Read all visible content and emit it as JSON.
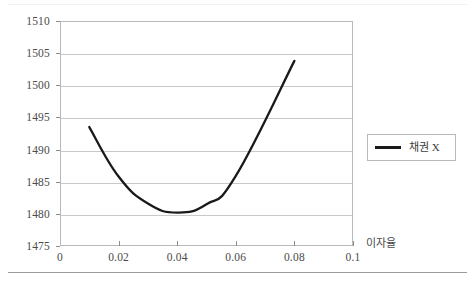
{
  "chart_data": {
    "type": "line",
    "title": "",
    "subtitle": "",
    "xlabel": "이자율",
    "ylabel": "",
    "xlim": [
      0,
      0.1
    ],
    "ylim": [
      1475,
      1510
    ],
    "grid": true,
    "legend_position": "right",
    "x_ticks": [
      "0",
      "0.02",
      "0.04",
      "0.06",
      "0.08",
      "0.1"
    ],
    "x_tick_values": [
      0,
      0.02,
      0.04,
      0.06,
      0.08,
      0.1
    ],
    "y_ticks": [
      "1475",
      "1480",
      "1485",
      "1490",
      "1495",
      "1500",
      "1505",
      "1510"
    ],
    "y_tick_values": [
      1475,
      1480,
      1485,
      1490,
      1495,
      1500,
      1505,
      1510
    ],
    "series": [
      {
        "name": "채권 X",
        "color": "#1a1a1a",
        "x": [
          0.01,
          0.02,
          0.03,
          0.04,
          0.05,
          0.06,
          0.08
        ],
        "values": [
          1493.5,
          1485.8,
          1481.6,
          1480.2,
          1481.5,
          1485.9,
          1503.8
        ]
      }
    ]
  },
  "legend": {
    "entries": [
      {
        "label": "채권 X",
        "color": "#1a1a1a"
      }
    ]
  },
  "axes": {
    "x_title": "이자율"
  }
}
